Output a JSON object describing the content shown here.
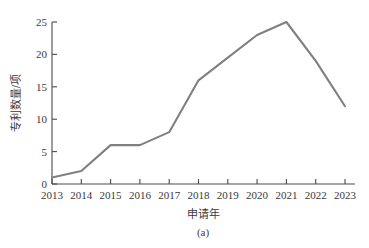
{
  "chart_data": {
    "type": "line",
    "title": "",
    "caption": "(a)",
    "xlabel": "申请年",
    "ylabel": "专利数量/项",
    "categories": [
      "2013",
      "2014",
      "2015",
      "2016",
      "2017",
      "2018",
      "2019",
      "2020",
      "2021",
      "2022",
      "2023"
    ],
    "x": [
      2013,
      2014,
      2015,
      2016,
      2017,
      2018,
      2019,
      2020,
      2021,
      2022,
      2023
    ],
    "values": [
      1,
      2,
      6,
      6,
      8,
      16,
      19.5,
      23,
      25,
      19,
      12
    ],
    "series": [
      {
        "name": "专利数量",
        "values": [
          1,
          2,
          6,
          6,
          8,
          16,
          19.5,
          23,
          25,
          19,
          12
        ]
      }
    ],
    "xlim": [
      2013,
      2023
    ],
    "ylim": [
      0,
      25
    ],
    "ytick_labels": [
      "0",
      "5",
      "10",
      "15",
      "20",
      "25"
    ],
    "yticks": [
      0,
      5,
      10,
      15,
      20,
      25
    ],
    "grid": false,
    "legend": "none",
    "line_color": "#808080",
    "axis_color": "#4a4a4a"
  },
  "axes": {
    "y_label": "专利数量/项",
    "x_label": "申请年"
  },
  "figure": {
    "caption": "(a)"
  }
}
